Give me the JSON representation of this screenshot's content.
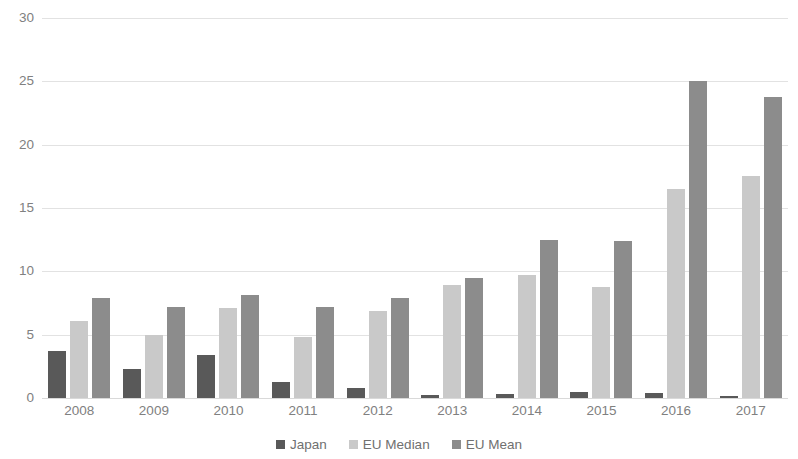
{
  "chart_data": {
    "type": "bar",
    "title": "",
    "subtitle": "",
    "xlabel": "",
    "ylabel": "",
    "ylim": [
      0,
      30
    ],
    "yticks": [
      0,
      5,
      10,
      15,
      20,
      25,
      30
    ],
    "ytick_labels": [
      "0",
      "5",
      "10",
      "15",
      "20",
      "25",
      "30"
    ],
    "grid": true,
    "legend_position": "bottom",
    "categories": [
      "2008",
      "2009",
      "2010",
      "2011",
      "2012",
      "2013",
      "2014",
      "2015",
      "2016",
      "2017"
    ],
    "series": [
      {
        "name": "Japan",
        "color": "#595959",
        "values": [
          3.7,
          2.3,
          3.4,
          1.3,
          0.8,
          0.2,
          0.3,
          0.5,
          0.4,
          0.15
        ]
      },
      {
        "name": "EU Median",
        "color": "#c9c9c9",
        "values": [
          6.1,
          5.0,
          7.1,
          4.8,
          6.9,
          8.9,
          9.7,
          8.8,
          16.5,
          17.5
        ]
      },
      {
        "name": "EU Mean",
        "color": "#8c8c8c",
        "values": [
          7.9,
          7.2,
          8.1,
          7.2,
          7.9,
          9.5,
          12.5,
          12.4,
          25.0,
          23.8
        ]
      }
    ]
  },
  "legend": {
    "items": [
      {
        "label": "Japan",
        "color": "#595959"
      },
      {
        "label": "EU Median",
        "color": "#c9c9c9"
      },
      {
        "label": "EU Mean",
        "color": "#8c8c8c"
      }
    ]
  },
  "colors": {
    "background": "#ffffff",
    "gridline": "#e2e2e2",
    "axis_text": "#808080",
    "legend_text": "#707070"
  }
}
